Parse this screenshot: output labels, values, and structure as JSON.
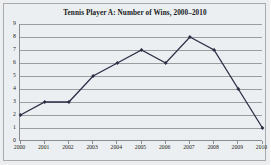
{
  "chart_data": {
    "type": "line",
    "title": "Tennis Player A: Number of Wins, 2000–2010",
    "xlabel": "",
    "ylabel": "",
    "categories": [
      "2000",
      "2001",
      "2002",
      "2003",
      "2004",
      "2005",
      "2006",
      "2007",
      "2008",
      "2009",
      "2010"
    ],
    "values": [
      2,
      3,
      3,
      5,
      6,
      7,
      6,
      8,
      7,
      4,
      1
    ],
    "series": [
      {
        "name": "Number of Wins",
        "values": [
          2,
          3,
          3,
          5,
          6,
          7,
          6,
          8,
          7,
          4,
          1
        ]
      }
    ],
    "ylim": [
      0,
      9
    ],
    "yticks": [
      0,
      1,
      2,
      3,
      4,
      5,
      6,
      7,
      8,
      9
    ],
    "ytick_labels": [
      "0",
      "1",
      "2",
      "3",
      "4",
      "5",
      "6",
      "7",
      "8",
      "9"
    ],
    "grid": true,
    "grid_axis": "y",
    "legend": false,
    "legend_position": "none",
    "marker": "diamond",
    "line_color": "#2b2f45",
    "grid_color": "#9a9da0",
    "axis_color": "#8a8d90",
    "background_color": "#eceff1",
    "title_color": "#16181c"
  }
}
